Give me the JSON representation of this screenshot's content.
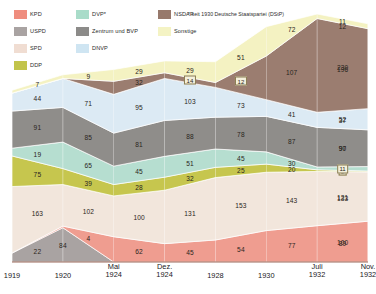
{
  "legend": {
    "items": [
      {
        "label": "KPD",
        "color": "#ef8d7e",
        "col": 1
      },
      {
        "label": "USPD",
        "color": "#a9a3a2",
        "col": 1
      },
      {
        "label": "SPD",
        "color": "#f0ddd2",
        "col": 1
      },
      {
        "label": "DDP",
        "color": "#c2c44b",
        "col": 1
      },
      {
        "label": "DVP*",
        "color": "#a9dcc9",
        "col": 2
      },
      {
        "label": "Zentrum und BVP",
        "color": "#8c8b89",
        "col": 2
      },
      {
        "label": "DNVP",
        "color": "#cfe5f2",
        "col": 2
      },
      {
        "label": "NSDAP",
        "color": "#97796c",
        "col": 3
      },
      {
        "label": "Sonstige",
        "color": "#f4f3c4",
        "col": 3
      }
    ],
    "footnote": "* seit 1930 Deutsche Staatspartei (DStP)"
  },
  "chart_data": {
    "type": "area",
    "title": "",
    "xlabel": "",
    "ylabel": "",
    "stacked": true,
    "grid": false,
    "legend_position": "top-left-overlay",
    "categories": [
      "1919",
      "1920",
      "Mai 1924",
      "Dez. 1924",
      "1928",
      "1930",
      "Juli 1932",
      "Nov. 1932"
    ],
    "category_lines": [
      {
        "l1": "",
        "l2": "1919"
      },
      {
        "l1": "",
        "l2": "1920"
      },
      {
        "l1": "Mai",
        "l2": "1924"
      },
      {
        "l1": "Dez.",
        "l2": "1924"
      },
      {
        "l1": "",
        "l2": "1928"
      },
      {
        "l1": "",
        "l2": "1930"
      },
      {
        "l1": "Juli",
        "l2": "1932"
      },
      {
        "l1": "Nov.",
        "l2": "1932"
      }
    ],
    "series": [
      {
        "name": "USPD",
        "color": "#a9a3a2",
        "values": [
          22,
          84,
          0,
          0,
          0,
          0,
          0,
          0
        ],
        "labels": [
          "22",
          "84",
          "",
          "",
          "",
          "",
          "",
          ""
        ]
      },
      {
        "name": "KPD",
        "color": "#ef9d90",
        "values": [
          0,
          4,
          62,
          45,
          54,
          77,
          89,
          100
        ],
        "labels": [
          "",
          "4",
          "62",
          "45",
          "54",
          "77",
          "89",
          "100"
        ]
      },
      {
        "name": "SPD",
        "color": "#f2e6dc",
        "values": [
          163,
          102,
          100,
          131,
          153,
          143,
          133,
          121
        ],
        "labels": [
          "163",
          "102",
          "100",
          "131",
          "153",
          "143",
          "133",
          "121"
        ]
      },
      {
        "name": "DDP",
        "color": "#c6c64e",
        "values": [
          75,
          39,
          28,
          32,
          25,
          20,
          4,
          2
        ],
        "labels": [
          "75",
          "39",
          "28",
          "32",
          "25",
          "20",
          "4",
          "2"
        ],
        "boxed": [
          false,
          false,
          false,
          false,
          false,
          false,
          true,
          true
        ]
      },
      {
        "name": "DVP*",
        "color": "#b6ded0",
        "values": [
          19,
          65,
          45,
          51,
          45,
          30,
          7,
          11
        ],
        "labels": [
          "19",
          "65",
          "45",
          "51",
          "45",
          "30",
          "7",
          "11"
        ],
        "boxed": [
          false,
          false,
          false,
          false,
          false,
          false,
          false,
          true
        ]
      },
      {
        "name": "Zentrum und BVP",
        "color": "#8f8d8a",
        "values": [
          91,
          85,
          81,
          88,
          78,
          87,
          97,
          90
        ],
        "labels": [
          "91",
          "85",
          "81",
          "88",
          "78",
          "87",
          "97",
          "90"
        ]
      },
      {
        "name": "DNVP",
        "color": "#dceaf4",
        "values": [
          44,
          71,
          95,
          103,
          73,
          41,
          37,
          52
        ],
        "labels": [
          "44",
          "71",
          "95",
          "103",
          "73",
          "41",
          "37",
          "52"
        ]
      },
      {
        "name": "NSDAP",
        "color": "#9b7d70",
        "values": [
          0,
          0,
          32,
          14,
          12,
          107,
          230,
          196
        ],
        "labels": [
          "",
          "",
          "32",
          "14",
          "12",
          "107",
          "230",
          "196"
        ],
        "boxed": [
          false,
          false,
          false,
          true,
          true,
          false,
          false,
          false
        ]
      },
      {
        "name": "Sonstige",
        "color": "#f4f2c2",
        "values": [
          7,
          9,
          29,
          29,
          51,
          72,
          11,
          12
        ],
        "labels": [
          "7",
          "9",
          "29",
          "29",
          "51",
          "72",
          "11",
          "12"
        ]
      }
    ]
  }
}
